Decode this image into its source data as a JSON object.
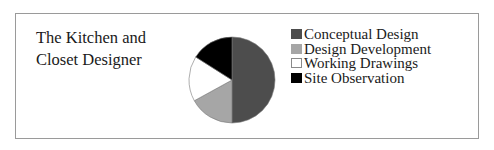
{
  "title_lines": [
    "The Kitchen and",
    "Closet Designer"
  ],
  "chart_data": {
    "type": "pie",
    "title": "The Kitchen and Closet Designer",
    "categories": [
      "Conceptual Design",
      "Design Development",
      "Working Drawings",
      "Site Observation"
    ],
    "values": [
      50,
      17,
      17,
      16
    ],
    "unit": "percent (estimated)",
    "colors": [
      "#4d4d4d",
      "#a6a6a6",
      "#ffffff",
      "#000000"
    ],
    "start_angle": "12 o'clock, clockwise",
    "legend_position": "right"
  },
  "legend": [
    {
      "label": "Conceptual Design",
      "color": "#4d4d4d"
    },
    {
      "label": "Design Development",
      "color": "#a6a6a6"
    },
    {
      "label": "Working Drawings",
      "color": "#ffffff"
    },
    {
      "label": "Site Observation",
      "color": "#000000"
    }
  ]
}
